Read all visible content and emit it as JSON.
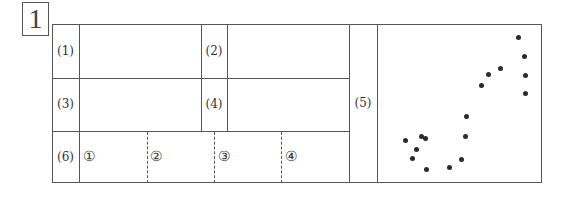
{
  "question_number": "1",
  "rows": [
    {
      "label": "(1)"
    },
    {
      "label": "(2)"
    },
    {
      "label": "(3)"
    },
    {
      "label": "(4)"
    },
    {
      "label": "(5)"
    },
    {
      "label": "(6)"
    }
  ],
  "subanswers": [
    "①",
    "②",
    "③",
    "④"
  ],
  "scatter_points": [
    [
      405.7,
      140
    ],
    [
      421.7,
      136.7
    ],
    [
      425,
      138.3
    ],
    [
      416.7,
      149.3
    ],
    [
      412.3,
      158.3
    ],
    [
      426.7,
      169.3
    ],
    [
      449,
      167.7
    ],
    [
      461.7,
      159.7
    ],
    [
      465,
      136.7
    ],
    [
      466,
      116
    ],
    [
      481,
      85
    ],
    [
      488.7,
      74.3
    ],
    [
      500,
      68.3
    ],
    [
      518.3,
      37.7
    ],
    [
      524,
      56
    ],
    [
      525,
      75.7
    ],
    [
      525,
      93
    ]
  ]
}
